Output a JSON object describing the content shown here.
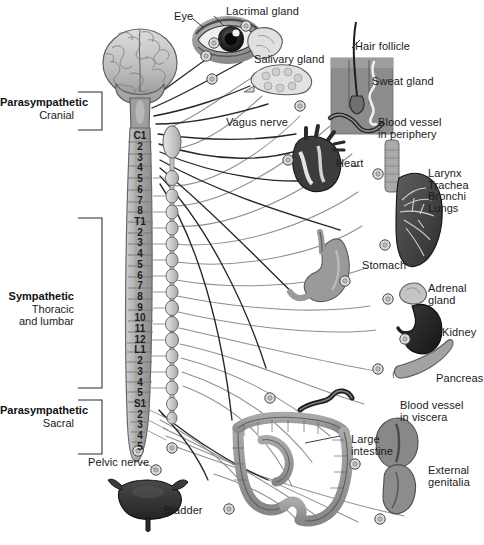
{
  "figure": {
    "background_color": "#ffffff",
    "ink_color": "#1a1a1a"
  },
  "divisions": [
    {
      "id": "parasympathetic-cranial",
      "name": "Parasympathetic",
      "subtitle": "Cranial",
      "bracket": {
        "x": 78,
        "y": 92,
        "w": 24,
        "h": 38
      }
    },
    {
      "id": "sympathetic-thoracolumbar",
      "name": "Sympathetic",
      "subtitle": "Thoracic\nand lumbar",
      "bracket": {
        "x": 78,
        "y": 218,
        "w": 24,
        "h": 170
      }
    },
    {
      "id": "parasympathetic-sacral",
      "name": "Parasympathetic",
      "subtitle": "Sacral",
      "bracket": {
        "x": 78,
        "y": 400,
        "w": 24,
        "h": 54
      }
    }
  ],
  "spinal_segments": {
    "cervical": [
      "C1",
      "2",
      "3",
      "4",
      "5",
      "6",
      "7",
      "8"
    ],
    "thoracic": [
      "T1",
      "2",
      "3",
      "4",
      "5",
      "6",
      "7",
      "8",
      "9",
      "10",
      "11",
      "12"
    ],
    "lumbar": [
      "L1",
      "2",
      "3",
      "4",
      "5"
    ],
    "sacral": [
      "S1",
      "2",
      "3",
      "4",
      "5"
    ]
  },
  "structures": [
    {
      "id": "brain",
      "label": "",
      "label_x": 0,
      "label_y": 0
    },
    {
      "id": "eye",
      "label": "Eye",
      "label_x": 174,
      "label_y": 11
    },
    {
      "id": "lacrimal-gland",
      "label": "Lacrimal gland",
      "label_x": 226,
      "label_y": 6
    },
    {
      "id": "salivary-gland",
      "label": "Salivary gland",
      "label_x": 254,
      "label_y": 54
    },
    {
      "id": "hair-follicle",
      "label": "Hair follicle",
      "label_x": 355,
      "label_y": 41
    },
    {
      "id": "sweat-gland",
      "label": "Sweat gland",
      "label_x": 372,
      "label_y": 76
    },
    {
      "id": "blood-vessel-periphery",
      "label": "Blood vessel\nin periphery",
      "label_x": 378,
      "label_y": 117
    },
    {
      "id": "vagus-nerve",
      "label": "Vagus nerve",
      "label_x": 226,
      "label_y": 117
    },
    {
      "id": "heart",
      "label": "Heart",
      "label_x": 336,
      "label_y": 158
    },
    {
      "id": "larynx-trachea-bronchi-lungs",
      "label": "Larynx\nTrachea\nBronchi\nLungs",
      "label_x": 428,
      "label_y": 168
    },
    {
      "id": "stomach",
      "label": "Stomach",
      "label_x": 362,
      "label_y": 260
    },
    {
      "id": "adrenal-gland",
      "label": "Adrenal\ngland",
      "label_x": 428,
      "label_y": 283
    },
    {
      "id": "kidney",
      "label": "Kidney",
      "label_x": 442,
      "label_y": 327
    },
    {
      "id": "pancreas",
      "label": "Pancreas",
      "label_x": 436,
      "label_y": 373
    },
    {
      "id": "blood-vessel-viscera",
      "label": "Blood vessel\nin viscera",
      "label_x": 400,
      "label_y": 400
    },
    {
      "id": "large-intestine",
      "label": "Large\nintestine",
      "label_x": 351,
      "label_y": 434
    },
    {
      "id": "external-genitalia",
      "label": "External\ngenitalia",
      "label_x": 428,
      "label_y": 465
    },
    {
      "id": "bladder",
      "label": "Bladder",
      "label_x": 164,
      "label_y": 505
    },
    {
      "id": "pelvic-nerve",
      "label": "Pelvic nerve",
      "label_x": 88,
      "label_y": 457
    }
  ],
  "palette": {
    "paper": "#ffffff",
    "ink": "#1a1a1a",
    "nerve_dark": "#2b2b2b",
    "nerve_light": "#8f8f8f",
    "cord_fill": "#b9b9b9",
    "cord_edge": "#6e6e6e",
    "brain_fill": "#c9c9c9",
    "brain_edge": "#6a6a6a",
    "organ_mid": "#9a9a9a",
    "organ_dark": "#3e3e3e",
    "organ_light": "#d4d4d4",
    "ganglion_fill": "#d9d9d9",
    "skin_block": "#8c8c8c"
  }
}
